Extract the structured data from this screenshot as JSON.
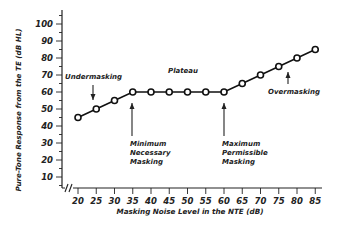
{
  "chart_data": {
    "type": "line",
    "title": "",
    "xlabel": "Masking Noise Level in the NTE (dB)",
    "ylabel": "Pure-Tone Response from the TE (dB HL)",
    "x": [
      20,
      25,
      30,
      35,
      40,
      45,
      50,
      55,
      60,
      65,
      70,
      75,
      80,
      85
    ],
    "series": [
      {
        "name": "Pure-tone threshold",
        "values": [
          45,
          50,
          55,
          60,
          60,
          60,
          60,
          60,
          60,
          65,
          70,
          75,
          80,
          85
        ]
      }
    ],
    "xticks": [
      "20",
      "25",
      "30",
      "35",
      "40",
      "45",
      "50",
      "55",
      "60",
      "65",
      "70",
      "75",
      "80",
      "85"
    ],
    "yticks": [
      "10",
      "20",
      "30",
      "40",
      "50",
      "60",
      "70",
      "80",
      "90",
      "100"
    ],
    "xlim": [
      20,
      85
    ],
    "ylim": [
      0,
      105
    ],
    "grid": false,
    "legend": "none",
    "axis_break": "//",
    "annotations": [
      {
        "id": "undermasking",
        "text": [
          "Undermasking"
        ],
        "arrow": "down",
        "at_x": 24
      },
      {
        "id": "plateau",
        "text": [
          "Plateau"
        ],
        "arrow": "none",
        "at_x": 47
      },
      {
        "id": "min-masking",
        "text": [
          "Minimum",
          "Necessary",
          "Masking"
        ],
        "arrow": "up",
        "at_x": 35
      },
      {
        "id": "max-masking",
        "text": [
          "Maximum",
          "Permissible",
          "Masking"
        ],
        "arrow": "up",
        "at_x": 60
      },
      {
        "id": "overmasking",
        "text": [
          "Overmasking"
        ],
        "arrow": "up",
        "at_x": 78
      }
    ]
  },
  "colors": {
    "line": "#111111",
    "marker_fill": "#ffffff",
    "text": "#222222"
  }
}
